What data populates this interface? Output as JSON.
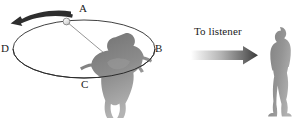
{
  "figure": {
    "caption_labels": {
      "A": "A",
      "B": "B",
      "C": "C",
      "D": "D",
      "to_listener": "To listener"
    },
    "colors": {
      "background": "#ffffff",
      "ink": "#1a1a1a",
      "ellipse_stroke": "#2b2b2b",
      "silhouette_dark": "#7d7d7d",
      "silhouette_light": "#a8a8a8",
      "listener_fill": "#8d8d8d",
      "arrow_dark": "#3a3a3a",
      "arrow_light": "#f2f2f2",
      "string_stroke": "#8a8a8a",
      "ball_fill": "#dcdcdc",
      "ball_stroke": "#7a7a7a"
    },
    "icons": {
      "rotation_arrow": "curved-arrow-counterclockwise-icon",
      "direction_arrow": "arrow-right-gradient-icon",
      "whirler": "person-whirling-silhouette-icon",
      "listener": "person-standing-silhouette-icon",
      "ball": "ball-on-string-icon",
      "orbit": "ellipse-orbit-path-icon"
    }
  }
}
